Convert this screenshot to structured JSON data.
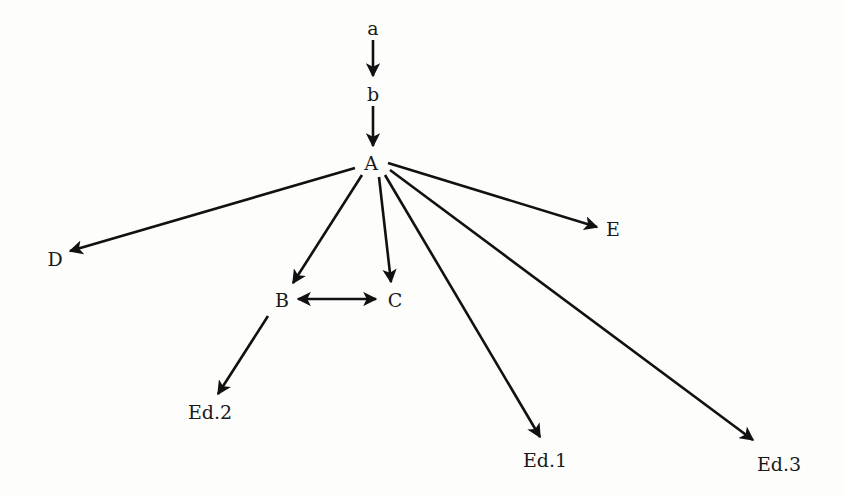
{
  "diagram": {
    "type": "stemma",
    "nodes": [
      {
        "id": "a",
        "label": "a",
        "x": 373,
        "y": 28
      },
      {
        "id": "b",
        "label": "b",
        "x": 373,
        "y": 94
      },
      {
        "id": "A",
        "label": "A",
        "x": 371,
        "y": 163
      },
      {
        "id": "D",
        "label": "D",
        "x": 55,
        "y": 259
      },
      {
        "id": "E",
        "label": "E",
        "x": 613,
        "y": 229
      },
      {
        "id": "B",
        "label": "B",
        "x": 282,
        "y": 300
      },
      {
        "id": "C",
        "label": "C",
        "x": 395,
        "y": 300
      },
      {
        "id": "Ed2",
        "label": "Ed.2",
        "x": 210,
        "y": 412
      },
      {
        "id": "Ed1",
        "label": "Ed.1",
        "x": 545,
        "y": 460
      },
      {
        "id": "Ed3",
        "label": "Ed.3",
        "x": 779,
        "y": 464
      }
    ],
    "edges": [
      {
        "from": "a",
        "to": "b",
        "directed": true
      },
      {
        "from": "b",
        "to": "A",
        "directed": true
      },
      {
        "from": "A",
        "to": "D",
        "directed": true
      },
      {
        "from": "A",
        "to": "E",
        "directed": true
      },
      {
        "from": "A",
        "to": "B",
        "directed": true
      },
      {
        "from": "A",
        "to": "C",
        "directed": true
      },
      {
        "from": "A",
        "to": "Ed1",
        "directed": true
      },
      {
        "from": "A",
        "to": "Ed3",
        "directed": true
      },
      {
        "from": "B",
        "to": "C",
        "directed": true,
        "bidirectional": true
      },
      {
        "from": "B",
        "to": "Ed2",
        "directed": true
      }
    ],
    "colors": {
      "ink": "#111111",
      "background": "#fdfdfc"
    }
  }
}
